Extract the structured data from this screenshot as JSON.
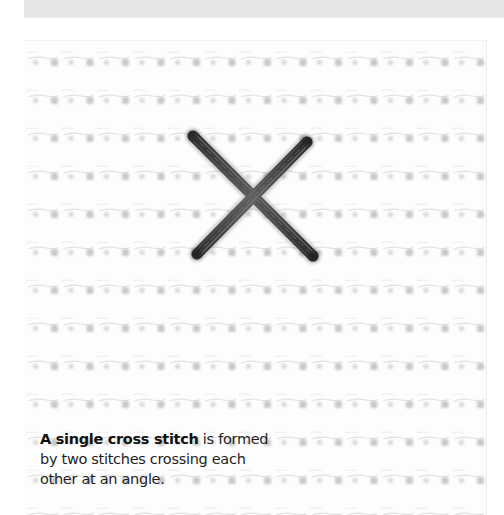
{
  "caption": {
    "bold": "A single cross stitch",
    "rest": " is formed by two stitches crossing each other at an angle."
  },
  "illustration": {
    "subject": "cross-stitch on aida fabric",
    "thread_color": "#4a4a4a",
    "fabric_color": "#fdfdfd",
    "hole_color": "#c8c8c8"
  },
  "colors": {
    "top_band": "#e5e5e5",
    "background": "#ffffff",
    "text": "#1f1f1f"
  }
}
